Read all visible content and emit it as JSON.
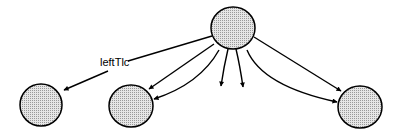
{
  "diagram": {
    "fill_color": "#d9d9d9",
    "stroke_color": "#000000",
    "nodes": [
      {
        "id": "root",
        "cx": 233,
        "cy": 28,
        "rx": 22,
        "ry": 21
      },
      {
        "id": "left",
        "cx": 41,
        "cy": 105,
        "rx": 21,
        "ry": 21
      },
      {
        "id": "mid-left",
        "cx": 131,
        "cy": 106,
        "rx": 22,
        "ry": 21
      },
      {
        "id": "right",
        "cx": 360,
        "cy": 107,
        "rx": 22,
        "ry": 21
      }
    ],
    "edges": [
      {
        "from": "root",
        "to": "left",
        "label": "leftTlc"
      },
      {
        "from": "root",
        "to": "mid-left",
        "label": ""
      },
      {
        "from": "root",
        "to": "mid-left",
        "label": ""
      },
      {
        "from": "root",
        "to": "open-1",
        "label": ""
      },
      {
        "from": "root",
        "to": "open-2",
        "label": ""
      },
      {
        "from": "root",
        "to": "right",
        "label": ""
      },
      {
        "from": "root",
        "to": "right",
        "label": ""
      }
    ],
    "edge_label": "leftTlc"
  }
}
